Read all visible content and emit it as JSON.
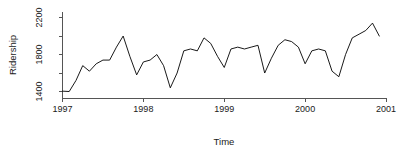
{
  "chart_data": {
    "type": "line",
    "title": "",
    "xlabel": "Time",
    "ylabel": "Ridership",
    "xlim": [
      1997.0,
      2001.0
    ],
    "ylim": [
      1330,
      2260
    ],
    "xticks": [
      1997,
      1998,
      1999,
      2000,
      2001
    ],
    "xtick_labels": [
      "1997",
      "1998",
      "1999",
      "2000",
      "2001"
    ],
    "yticks": [
      1400,
      1800,
      2200
    ],
    "ytick_labels": [
      "1400",
      "1800",
      "2200"
    ],
    "yticks_minor": [
      1600,
      2000
    ],
    "grid": false,
    "legend": false,
    "line_color": "#000000",
    "axis_color": "#555555",
    "background": "#ffffff",
    "series": [
      {
        "name": "Ridership",
        "x": [
          1997.0,
          1997.083,
          1997.167,
          1997.25,
          1997.333,
          1997.417,
          1997.5,
          1997.583,
          1997.667,
          1997.75,
          1997.833,
          1997.917,
          1998.0,
          1998.083,
          1998.167,
          1998.25,
          1998.333,
          1998.417,
          1998.5,
          1998.583,
          1998.667,
          1998.75,
          1998.833,
          1998.917,
          1999.0,
          1999.083,
          1999.167,
          1999.25,
          1999.333,
          1999.417,
          1999.5,
          1999.583,
          1999.667,
          1999.75,
          1999.833,
          1999.917,
          2000.0,
          2000.083,
          2000.167,
          2000.25,
          2000.333,
          2000.417,
          2000.5,
          2000.583,
          2000.667,
          2000.75,
          2000.833,
          2000.917
        ],
        "values": [
          1404,
          1400,
          1520,
          1680,
          1620,
          1700,
          1740,
          1740,
          1880,
          2000,
          1780,
          1580,
          1720,
          1740,
          1800,
          1680,
          1440,
          1600,
          1840,
          1860,
          1840,
          1980,
          1920,
          1780,
          1660,
          1860,
          1880,
          1860,
          1880,
          1900,
          1600,
          1760,
          1900,
          1960,
          1940,
          1880,
          1700,
          1840,
          1860,
          1840,
          1620,
          1560,
          1800,
          1980,
          2020,
          2060,
          2140,
          2000
        ]
      }
    ]
  },
  "labels": {
    "y_axis_title": "Ridership",
    "x_axis_title": "Time"
  }
}
